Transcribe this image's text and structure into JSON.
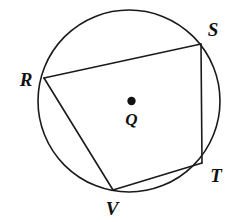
{
  "figure": {
    "kind": "circle-inscribed-quadrilateral-diagram",
    "background_color": "#ffffff",
    "stroke_color": "#1a1a1a",
    "label_color": "#111111",
    "width": 236,
    "height": 222
  },
  "chart_data": {
    "type": "diagram",
    "title": "",
    "subtitle": "",
    "xlabel": "",
    "ylabel": "",
    "grid": false,
    "legend": false,
    "circle": {
      "label": "",
      "center_name": "Q",
      "cx": 129,
      "cy": 101,
      "r": 91,
      "stroke_width": 1.6
    },
    "center_point": {
      "name": "Q",
      "x": 131.5,
      "y": 101,
      "dot_radius": 4.2,
      "label": "Q",
      "label_x": 131.5,
      "label_y": 119
    },
    "points": [
      {
        "name": "R",
        "x": 44,
        "y": 78,
        "label": "R",
        "label_x": 26,
        "label_y": 79
      },
      {
        "name": "S",
        "x": 201,
        "y": 44,
        "label": "S",
        "label_x": 213,
        "label_y": 29
      },
      {
        "name": "T",
        "x": 202,
        "y": 163,
        "label": "T",
        "label_x": 216,
        "label_y": 175
      },
      {
        "name": "V",
        "x": 113,
        "y": 190,
        "label": "V",
        "label_x": 112,
        "label_y": 208
      }
    ],
    "segments": [
      {
        "name": "RS",
        "from": "R",
        "to": "S",
        "x1": 44,
        "y1": 78,
        "x2": 201,
        "y2": 44,
        "stroke_width": 1.6
      },
      {
        "name": "ST",
        "from": "S",
        "to": "T",
        "x1": 201,
        "y1": 44,
        "x2": 202,
        "y2": 163,
        "stroke_width": 1.6
      },
      {
        "name": "TV",
        "from": "T",
        "to": "V",
        "x1": 202,
        "y1": 163,
        "x2": 113,
        "y2": 190,
        "stroke_width": 1.6
      },
      {
        "name": "VR",
        "from": "V",
        "to": "R",
        "x1": 113,
        "y1": 190,
        "x2": 44,
        "y2": 78,
        "stroke_width": 1.6
      }
    ]
  }
}
